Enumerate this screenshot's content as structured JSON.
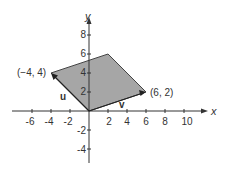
{
  "figure": {
    "axis_x_label": "x",
    "axis_y_label": "y",
    "x_ticks": [
      "-6",
      "-4",
      "-2",
      "2",
      "4",
      "6",
      "8",
      "10"
    ],
    "y_ticks": [
      "8",
      "6",
      "4",
      "2",
      "-2",
      "-4"
    ],
    "vector_u_label": "u",
    "vector_v_label": "v",
    "point_u_label": "(−4, 4)",
    "point_v_label": "(6, 2)",
    "fill_color": "#a6a6a6",
    "line_color": "#333333"
  }
}
